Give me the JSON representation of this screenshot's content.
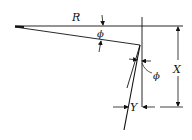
{
  "diagram": {
    "labels": {
      "R": "R",
      "phi_top": "ϕ",
      "phi_side": "ϕ",
      "X": "X",
      "Y": "Y"
    },
    "colors": {
      "line": "#111111",
      "background": "#ffffff"
    }
  }
}
